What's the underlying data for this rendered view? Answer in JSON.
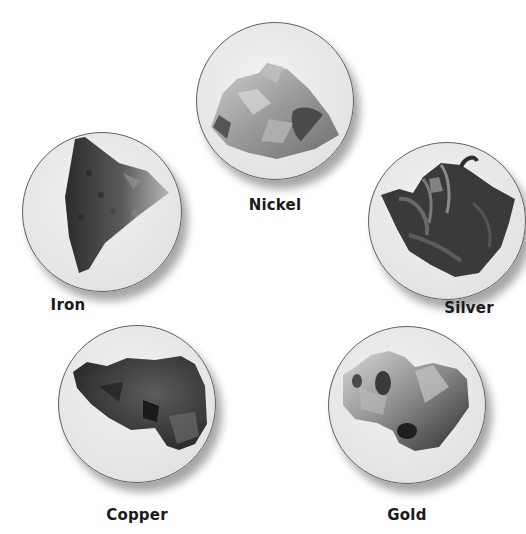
{
  "specimens": [
    {
      "id": "nickel",
      "label": "Nickel",
      "icon": "nickel-ore-icon"
    },
    {
      "id": "iron",
      "label": "Iron",
      "icon": "iron-ore-icon"
    },
    {
      "id": "silver",
      "label": "Silver",
      "icon": "silver-ore-icon"
    },
    {
      "id": "copper",
      "label": "Copper",
      "icon": "copper-ore-icon"
    },
    {
      "id": "gold",
      "label": "Gold",
      "icon": "gold-nugget-icon"
    }
  ],
  "colors": {
    "background": "#ffffff",
    "disc_fill": "#e6e6e6",
    "disc_border": "#5e5e5e",
    "label": "#1a1a1a"
  }
}
